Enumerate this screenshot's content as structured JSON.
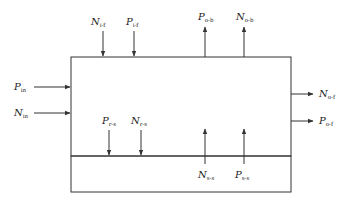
{
  "diagram": {
    "type": "flow-box",
    "colors": {
      "line": "#333333",
      "text": "#222222",
      "background": "#ffffff"
    },
    "boxes": [
      {
        "id": "upper",
        "x": 71,
        "y": 57,
        "w": 220,
        "h": 99
      },
      {
        "id": "lower",
        "x": 71,
        "y": 156,
        "w": 220,
        "h": 36
      }
    ],
    "labels": {
      "n_i_f": {
        "main": "N",
        "sub": "i-f"
      },
      "p_i_f": {
        "main": "P",
        "sub": "i-f"
      },
      "p_o_b": {
        "main": "P",
        "sub": "o-b"
      },
      "n_o_b": {
        "main": "N",
        "sub": "o-b"
      },
      "p_in": {
        "main": "P",
        "sub": "in"
      },
      "n_in": {
        "main": "N",
        "sub": "in"
      },
      "n_o_f": {
        "main": "N",
        "sub": "o-f"
      },
      "p_o_f": {
        "main": "P",
        "sub": "o-f"
      },
      "p_r_s": {
        "main": "P",
        "sub": "r-s"
      },
      "n_r_s": {
        "main": "N",
        "sub": "r-s"
      },
      "n_s_s": {
        "main": "N",
        "sub": "s-s"
      },
      "p_s_s": {
        "main": "P",
        "sub": "s-s"
      }
    }
  }
}
